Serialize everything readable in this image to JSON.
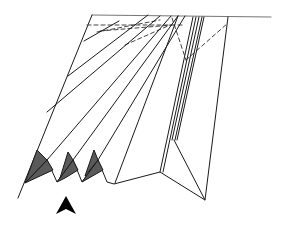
{
  "diagram": {
    "title": "Pleated fold diagram",
    "stroke_color": "#1a1a1a",
    "fill_shade": "#5a5a5a",
    "arrow_color": "#000000",
    "elements": {
      "top_edge": "top-edge",
      "left_edge": "left-outer-edge",
      "pleats": "pleat-lines",
      "valley_folds": "dashed-valley-fold-lines",
      "shaded_flaps": "shaded-flaps",
      "arrow": "push-arrow"
    }
  }
}
